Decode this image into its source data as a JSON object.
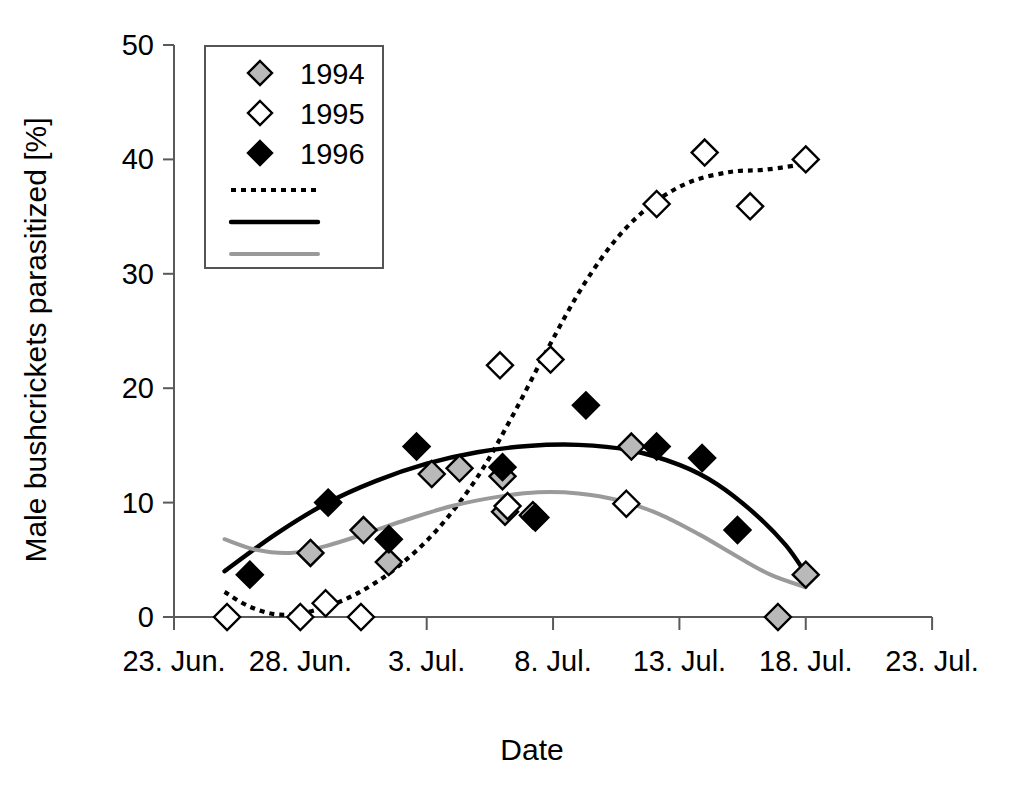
{
  "chart_data": {
    "type": "scatter",
    "title": "",
    "xlabel": "Date",
    "ylabel": "Male bushcrickets parasitized [%]",
    "ylim": [
      0,
      50
    ],
    "yticks": [
      0,
      10,
      20,
      30,
      40,
      50
    ],
    "yticklabels": [
      "0",
      "10",
      "20",
      "30",
      "40",
      "50"
    ],
    "xlim_days": [
      0,
      30
    ],
    "xticks_days": [
      0,
      5,
      10,
      15,
      20,
      25,
      30
    ],
    "xticklabels": [
      "23. Jun.",
      "28. Jun.",
      "3. Jul.",
      "8. Jul.",
      "13. Jul.",
      "18. Jul.",
      "23. Jul."
    ],
    "grid": false,
    "legend_position": "top-left",
    "legend_entries": [
      {
        "label": "1994",
        "marker": "diamond",
        "fill": "#b9b9b9",
        "edge": "#000000"
      },
      {
        "label": "1995",
        "marker": "diamond",
        "fill": "#ffffff",
        "edge": "#000000"
      },
      {
        "label": "1996",
        "marker": "diamond",
        "fill": "#000000",
        "edge": "#000000"
      },
      {
        "label": "",
        "marker": "line",
        "style": "dotted",
        "color": "#000000"
      },
      {
        "label": "",
        "marker": "line",
        "style": "solid",
        "color": "#000000"
      },
      {
        "label": "",
        "marker": "line",
        "style": "solid",
        "color": "#9a9a9a"
      }
    ],
    "series": [
      {
        "name": "1994",
        "marker": "gray-diamond",
        "points": [
          {
            "x_day": 5.4,
            "y": 5.6,
            "date": "28. Jun."
          },
          {
            "x_day": 7.5,
            "y": 7.6,
            "date": "30. Jun."
          },
          {
            "x_day": 8.5,
            "y": 4.8,
            "date": "1. Jul."
          },
          {
            "x_day": 10.2,
            "y": 12.5,
            "date": "3. Jul."
          },
          {
            "x_day": 11.3,
            "y": 13.0,
            "date": "4. Jul."
          },
          {
            "x_day": 13.0,
            "y": 12.3,
            "date": "6. Jul."
          },
          {
            "x_day": 13.1,
            "y": 9.2,
            "date": "6. Jul."
          },
          {
            "x_day": 14.2,
            "y": 8.9,
            "date": "7. Jul."
          },
          {
            "x_day": 18.1,
            "y": 14.9,
            "date": "11. Jul."
          },
          {
            "x_day": 23.9,
            "y": 0.0,
            "date": "17. Jul."
          },
          {
            "x_day": 25.0,
            "y": 3.7,
            "date": "18. Jul."
          }
        ]
      },
      {
        "name": "1995",
        "marker": "white-diamond",
        "points": [
          {
            "x_day": 2.1,
            "y": 0.0,
            "date": "25. Jun."
          },
          {
            "x_day": 5.0,
            "y": 0.0,
            "date": "28. Jun."
          },
          {
            "x_day": 6.0,
            "y": 1.2,
            "date": "29. Jun."
          },
          {
            "x_day": 7.4,
            "y": 0.0,
            "date": "30. Jun."
          },
          {
            "x_day": 12.9,
            "y": 22.0,
            "date": "5. Jul."
          },
          {
            "x_day": 14.9,
            "y": 22.5,
            "date": "7. Jul."
          },
          {
            "x_day": 13.2,
            "y": 9.7,
            "date": "6. Jul."
          },
          {
            "x_day": 17.9,
            "y": 9.9,
            "date": "11. Jul."
          },
          {
            "x_day": 19.1,
            "y": 36.1,
            "date": "12. Jul."
          },
          {
            "x_day": 21.0,
            "y": 40.6,
            "date": "14. Jul."
          },
          {
            "x_day": 22.8,
            "y": 35.9,
            "date": "16. Jul."
          },
          {
            "x_day": 25.0,
            "y": 40.0,
            "date": "18. Jul."
          }
        ]
      },
      {
        "name": "1996",
        "marker": "black-diamond",
        "points": [
          {
            "x_day": 3.0,
            "y": 3.7,
            "date": "26. Jun."
          },
          {
            "x_day": 6.1,
            "y": 10.0,
            "date": "29. Jun."
          },
          {
            "x_day": 8.5,
            "y": 6.8,
            "date": "1. Jul."
          },
          {
            "x_day": 9.6,
            "y": 14.9,
            "date": "2. Jul."
          },
          {
            "x_day": 13.0,
            "y": 13.1,
            "date": "6. Jul."
          },
          {
            "x_day": 14.3,
            "y": 8.7,
            "date": "7. Jul."
          },
          {
            "x_day": 16.3,
            "y": 18.5,
            "date": "9. Jul."
          },
          {
            "x_day": 19.1,
            "y": 14.9,
            "date": "12. Jul."
          },
          {
            "x_day": 20.9,
            "y": 13.9,
            "date": "14. Jul."
          },
          {
            "x_day": 22.3,
            "y": 7.6,
            "date": "15. Jul."
          }
        ]
      }
    ],
    "trend_lines": [
      {
        "name": "1995-trend",
        "style": "dotted",
        "color": "#000000",
        "points": [
          [
            2.0,
            2.2
          ],
          [
            3.0,
            0.9
          ],
          [
            4.2,
            0.2
          ],
          [
            5.6,
            0.6
          ],
          [
            7.2,
            2.0
          ],
          [
            8.8,
            4.3
          ],
          [
            10.4,
            7.6
          ],
          [
            12.0,
            12.2
          ],
          [
            13.4,
            17.6
          ],
          [
            14.8,
            23.5
          ],
          [
            16.2,
            29.0
          ],
          [
            17.6,
            33.3
          ],
          [
            19.0,
            36.2
          ],
          [
            20.4,
            38.0
          ],
          [
            22.0,
            38.9
          ],
          [
            23.4,
            39.1
          ],
          [
            25.0,
            39.6
          ]
        ]
      },
      {
        "name": "1996-trend",
        "style": "solid",
        "color": "#000000",
        "points": [
          [
            2.0,
            4.0
          ],
          [
            4.0,
            7.2
          ],
          [
            6.0,
            9.9
          ],
          [
            8.0,
            11.9
          ],
          [
            10.0,
            13.4
          ],
          [
            12.0,
            14.4
          ],
          [
            14.0,
            14.95
          ],
          [
            16.0,
            15.05
          ],
          [
            18.0,
            14.6
          ],
          [
            20.0,
            13.3
          ],
          [
            21.5,
            11.6
          ],
          [
            23.0,
            9.0
          ],
          [
            24.2,
            6.3
          ],
          [
            25.0,
            3.8
          ]
        ]
      },
      {
        "name": "1994-trend",
        "style": "solid",
        "color": "#9a9a9a",
        "points": [
          [
            2.0,
            6.8
          ],
          [
            3.2,
            5.9
          ],
          [
            4.6,
            5.6
          ],
          [
            6.0,
            6.2
          ],
          [
            7.6,
            7.3
          ],
          [
            9.2,
            8.5
          ],
          [
            11.0,
            9.7
          ],
          [
            12.8,
            10.5
          ],
          [
            14.4,
            10.9
          ],
          [
            16.0,
            10.8
          ],
          [
            17.6,
            10.2
          ],
          [
            19.2,
            9.0
          ],
          [
            20.8,
            7.2
          ],
          [
            22.2,
            5.4
          ],
          [
            23.6,
            3.7
          ],
          [
            25.0,
            2.6
          ]
        ]
      }
    ]
  }
}
